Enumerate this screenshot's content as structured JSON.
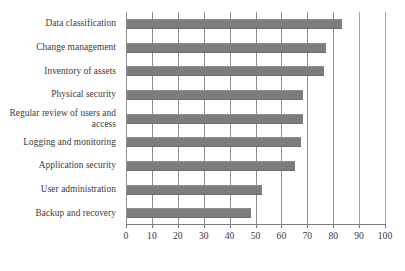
{
  "chart_data": {
    "type": "bar",
    "orientation": "horizontal",
    "title": "",
    "subtitle": "",
    "xlabel": "",
    "ylabel": "",
    "xlim": [
      0,
      100
    ],
    "xticks": [
      0,
      10,
      20,
      30,
      40,
      50,
      60,
      70,
      80,
      90,
      100
    ],
    "xtick_labels": [
      "0",
      "10",
      "20",
      "30",
      "40",
      "50",
      "60",
      "70",
      "80",
      "90",
      "100"
    ],
    "grid": "vertical",
    "legend": "none",
    "bar_color": "#7d7d7d",
    "categories": [
      "Data classification",
      "Change management",
      "Inventory of assets",
      "Physical security",
      "Regular review of users and access",
      "Logging and monitoring",
      "Application security",
      "User administration",
      "Backup and recovery"
    ],
    "values": [
      83,
      77,
      76,
      68,
      68,
      67,
      65,
      52,
      48
    ]
  }
}
